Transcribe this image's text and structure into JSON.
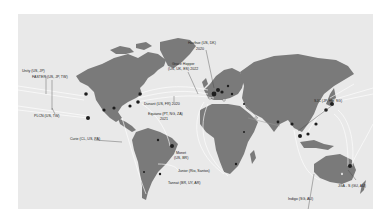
{
  "map": {
    "title": "Submarine cable map",
    "style": {
      "land": "#7a7a7a",
      "ocean": "#e9e9e9",
      "cable": "#ffffff",
      "landing_node": "#1e1e1e"
    },
    "labels": [
      {
        "id": "unity",
        "text": "Unity (US, JP)"
      },
      {
        "id": "faster",
        "text": "FASTER (US, JP, TW)"
      },
      {
        "id": "plcn",
        "text": "PLCN (US, TW)"
      },
      {
        "id": "curie",
        "text": "Curie (CL, US, PA)"
      },
      {
        "id": "dunant",
        "text": "Dunant (US, FR) 2020"
      },
      {
        "id": "equiano",
        "text": "Equiano (PT, NG, ZA)"
      },
      {
        "id": "equiano_year",
        "text": "2021"
      },
      {
        "id": "grace_hopper_a",
        "text": "Grace Hopper"
      },
      {
        "id": "grace_hopper_b",
        "text": "(US, UK, ES) 2022"
      },
      {
        "id": "havfrue",
        "text": "Havfrue (US, DK)"
      },
      {
        "id": "havfrue_year",
        "text": "2020"
      },
      {
        "id": "monet",
        "text": "Monet"
      },
      {
        "id": "monet_cc",
        "text": "(US, BR)"
      },
      {
        "id": "junior",
        "text": "Junior (Rio, Santos)"
      },
      {
        "id": "tannat",
        "text": "Tannat (BR, UY, AR)"
      },
      {
        "id": "sjc",
        "text": "SJC (JP, HK, SG)"
      },
      {
        "id": "jga",
        "text": "JGA - S (GU, AU)"
      },
      {
        "id": "indigo",
        "text": "Indigo (SG, AU)"
      }
    ]
  }
}
